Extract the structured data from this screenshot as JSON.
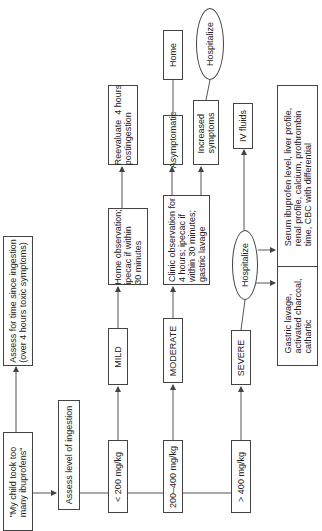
{
  "diagram": {
    "orientation": "rotated 90 degrees counter-clockwise (flows bottom-to-top)",
    "nodes": {
      "start": "\"My child took too\nmany ibuprofens\"",
      "assess_time": "Assess for time since ingestion\n(over 4 hours toxic symptoms)",
      "assess_level": "Assess level of ingestion",
      "range_low": "< 200 mg/kg",
      "range_mid": "200–400 mg/kg",
      "range_high": "> 400 mg/kg",
      "mild": "MILD",
      "moderate": "MODERATE",
      "severe": "SEVERE",
      "home_obs": "Home observation;\nipecac if within\n30 minutes",
      "reevaluate": "Reevaluate  4 hours\npostingestion",
      "clinic_obs": "Clinic observation for\n4 hours; ipecac if\nwithin 30 minutes;\ngastric lavage",
      "asymptomatic": "Asymptomatic",
      "home": "Home",
      "increased": "Increased\nsymptoms",
      "hospitalize_top": "Hospitalize",
      "hospitalize_severe": "Hospitalize",
      "iv_fluids": "IV fluids",
      "serum": "Serum ibuprofen level, liver profile,\nrenal profile, calcium, prothrombin\ntime, CBC with differential",
      "gastric": "Gastric lavage,\nactivated charcoal,\ncathartic"
    },
    "colors": {
      "line": "#444444",
      "background": "#ffffff",
      "text": "#222222"
    }
  }
}
